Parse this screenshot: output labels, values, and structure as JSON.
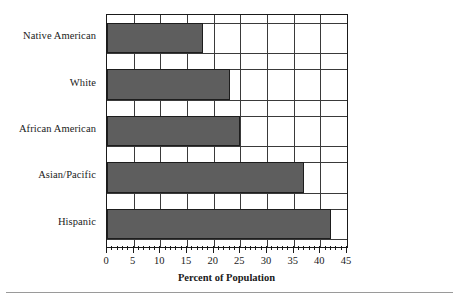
{
  "chart_data": {
    "type": "bar",
    "orientation": "horizontal",
    "title": "",
    "xlabel": "Percent of Population",
    "ylabel": "",
    "categories": [
      "Native American",
      "White",
      "African American",
      "Asian/Pacific",
      "Hispanic"
    ],
    "values": [
      18,
      23,
      25,
      37,
      42
    ],
    "xlim": [
      0,
      45
    ],
    "xticks": [
      0,
      5,
      10,
      15,
      20,
      25,
      30,
      35,
      40,
      45
    ],
    "xticklabels": [
      "0",
      "5",
      "10",
      "15",
      "20",
      "25",
      "30",
      "35",
      "40",
      "45"
    ],
    "minor_tick_step": 1,
    "grid": "both",
    "legend": "none",
    "bar_fill_color": "#5e5e5e",
    "bar_edge_color": "#1d1d1d",
    "grid_color": "#3a3a3a",
    "axis_color": "#1a1a1a",
    "background_color": "#ffffff"
  }
}
